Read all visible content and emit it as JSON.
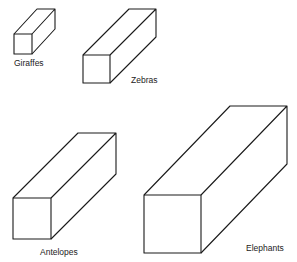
{
  "diagram": {
    "type": "proportional 3D boxes",
    "stroke_color": "#1a1a1a",
    "background": "#ffffff",
    "boxes": [
      {
        "name": "giraffes",
        "label": "Giraffes",
        "front": {
          "x": 14,
          "y": 34,
          "w": 18,
          "h": 20
        },
        "back_offset": {
          "dx": 23,
          "dy": -25
        },
        "label_pos": {
          "x": 14,
          "y": 58
        }
      },
      {
        "name": "zebras",
        "label": "Zebras",
        "front": {
          "x": 83,
          "y": 55,
          "w": 27,
          "h": 28
        },
        "back_offset": {
          "dx": 46,
          "dy": -46
        },
        "label_pos": {
          "x": 131,
          "y": 75
        }
      },
      {
        "name": "antelopes",
        "label": "Antelopes",
        "front": {
          "x": 13,
          "y": 198,
          "w": 38,
          "h": 41
        },
        "back_offset": {
          "dx": 65,
          "dy": -65
        },
        "label_pos": {
          "x": 40,
          "y": 247
        }
      },
      {
        "name": "elephants",
        "label": "Elephants",
        "front": {
          "x": 144,
          "y": 195,
          "w": 57,
          "h": 58
        },
        "back_offset": {
          "dx": 86,
          "dy": -89
        },
        "label_pos": {
          "x": 246,
          "y": 243
        }
      }
    ]
  }
}
